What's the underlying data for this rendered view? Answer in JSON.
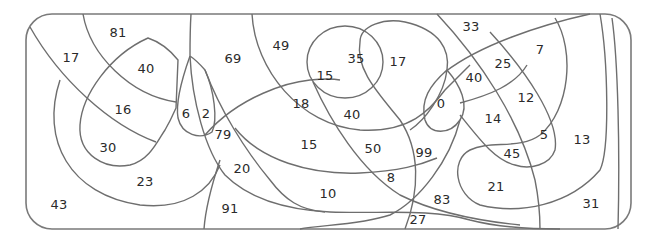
{
  "diagram": {
    "type": "numbered-region-puzzle",
    "line_color": "#6e6e6e",
    "background": "#ffffff",
    "labels": [
      {
        "value": "81",
        "x": 118,
        "y": 32
      },
      {
        "value": "17",
        "x": 71,
        "y": 57
      },
      {
        "value": "40",
        "x": 146,
        "y": 68
      },
      {
        "value": "16",
        "x": 123,
        "y": 109
      },
      {
        "value": "6",
        "x": 186,
        "y": 113
      },
      {
        "value": "2",
        "x": 206,
        "y": 113
      },
      {
        "value": "30",
        "x": 108,
        "y": 147
      },
      {
        "value": "23",
        "x": 145,
        "y": 181
      },
      {
        "value": "43",
        "x": 59,
        "y": 204
      },
      {
        "value": "69",
        "x": 233,
        "y": 58
      },
      {
        "value": "79",
        "x": 223,
        "y": 134
      },
      {
        "value": "20",
        "x": 242,
        "y": 168
      },
      {
        "value": "91",
        "x": 230,
        "y": 208
      },
      {
        "value": "49",
        "x": 281,
        "y": 45
      },
      {
        "value": "15",
        "x": 325,
        "y": 75
      },
      {
        "value": "35",
        "x": 356,
        "y": 58
      },
      {
        "value": "17",
        "x": 398,
        "y": 61
      },
      {
        "value": "18",
        "x": 301,
        "y": 103
      },
      {
        "value": "40",
        "x": 352,
        "y": 114
      },
      {
        "value": "15",
        "x": 309,
        "y": 144
      },
      {
        "value": "50",
        "x": 373,
        "y": 148
      },
      {
        "value": "8",
        "x": 391,
        "y": 177
      },
      {
        "value": "10",
        "x": 328,
        "y": 193
      },
      {
        "value": "99",
        "x": 424,
        "y": 152
      },
      {
        "value": "27",
        "x": 418,
        "y": 219
      },
      {
        "value": "83",
        "x": 442,
        "y": 199
      },
      {
        "value": "33",
        "x": 471,
        "y": 26
      },
      {
        "value": "7",
        "x": 540,
        "y": 49
      },
      {
        "value": "25",
        "x": 503,
        "y": 63
      },
      {
        "value": "40",
        "x": 474,
        "y": 77
      },
      {
        "value": "0",
        "x": 441,
        "y": 103
      },
      {
        "value": "12",
        "x": 526,
        "y": 97
      },
      {
        "value": "14",
        "x": 493,
        "y": 118
      },
      {
        "value": "5",
        "x": 544,
        "y": 134
      },
      {
        "value": "45",
        "x": 512,
        "y": 153
      },
      {
        "value": "13",
        "x": 582,
        "y": 139
      },
      {
        "value": "21",
        "x": 496,
        "y": 186
      },
      {
        "value": "31",
        "x": 591,
        "y": 203
      }
    ]
  }
}
